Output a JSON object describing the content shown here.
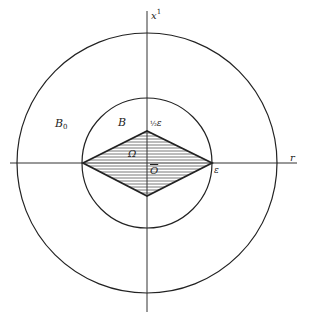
{
  "diagram": {
    "axes": {
      "vertical_label": "x",
      "vertical_label_sup": "1",
      "horizontal_label": "r"
    },
    "regions": {
      "outer_label": "B",
      "outer_label_sub": "0",
      "inner_label": "B",
      "domain_label": "Ω",
      "origin_label": "O"
    },
    "points": {
      "top_vertex_label_frac": "½",
      "top_vertex_label": "ε",
      "right_vertex_label": "ε"
    },
    "colors": {
      "stroke": "#222222",
      "hatch": "#555555",
      "background": "#ffffff"
    }
  }
}
